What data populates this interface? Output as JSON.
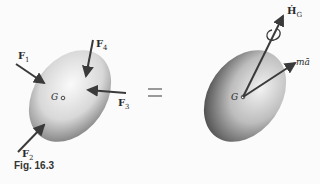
{
  "figure": {
    "caption": "Fig. 16.3",
    "equals": "=",
    "left_body": {
      "center_label": "G",
      "forces": [
        {
          "name": "F",
          "sub": "1"
        },
        {
          "name": "F",
          "sub": "2"
        },
        {
          "name": "F",
          "sub": "3"
        },
        {
          "name": "F",
          "sub": "4"
        }
      ]
    },
    "right_body": {
      "center_label": "G",
      "vectors": [
        {
          "label": "Ḣ",
          "sub": "G",
          "kind": "couple"
        },
        {
          "label": "mā",
          "kind": "force"
        }
      ]
    }
  },
  "colors": {
    "arrow": "#3a3a3a",
    "body_light": "#f4f4f4",
    "body_dark": "#7a7a7a",
    "background": "#fbfbfb"
  }
}
